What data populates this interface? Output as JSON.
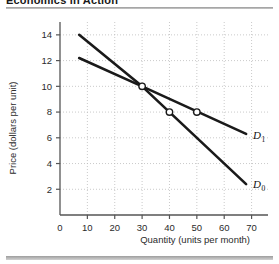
{
  "figure": {
    "title": "Economics in Action",
    "top_rule_color": "#9a9a9a",
    "bottom_rule_color": "#9d9d9d"
  },
  "chart_data": {
    "type": "line",
    "title": "",
    "xlabel": "Quantity (units per month)",
    "ylabel": "Price (dollars per unit)",
    "xlim": [
      0,
      76
    ],
    "ylim": [
      0,
      15
    ],
    "xticks": [
      0,
      10,
      20,
      30,
      40,
      50,
      60,
      70
    ],
    "yticks": [
      2,
      4,
      6,
      8,
      10,
      12,
      14
    ],
    "xtick_labels": [
      "0",
      "10",
      "20",
      "30",
      "40",
      "50",
      "60",
      "70"
    ],
    "ytick_labels": [
      "2",
      "4",
      "6",
      "8",
      "10",
      "12",
      "14"
    ],
    "grid": true,
    "grid_style": "dotted",
    "grid_color": "#bdbdbd",
    "legend_position": "inline-right",
    "line_color": "#1a1a1a",
    "series": [
      {
        "name": "D0",
        "label": "D",
        "subscript": "0",
        "points": [
          {
            "x": 7,
            "y": 14.0
          },
          {
            "x": 30,
            "y": 10.0
          },
          {
            "x": 68,
            "y": 2.4
          }
        ],
        "label_position": {
          "x": 70.5,
          "y": 2.4
        }
      },
      {
        "name": "D1",
        "label": "D",
        "subscript": "1",
        "points": [
          {
            "x": 7,
            "y": 12.2
          },
          {
            "x": 30,
            "y": 10.0
          },
          {
            "x": 68,
            "y": 6.3
          }
        ],
        "label_position": {
          "x": 70.5,
          "y": 6.2
        }
      }
    ],
    "markers": [
      {
        "x": 30,
        "y": 10,
        "style": "open-circle",
        "series": "intersection"
      },
      {
        "x": 40,
        "y": 8,
        "style": "open-circle",
        "series": "D0"
      },
      {
        "x": 50,
        "y": 8,
        "style": "open-circle",
        "series": "D1"
      }
    ]
  }
}
